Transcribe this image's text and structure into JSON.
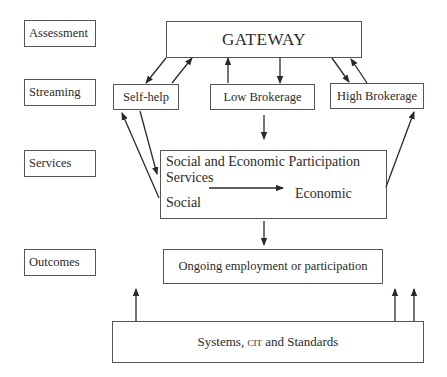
{
  "stages": [
    {
      "id": "assessment",
      "label": "Assessment"
    },
    {
      "id": "streaming",
      "label": "Streaming"
    },
    {
      "id": "services",
      "label": "Services"
    },
    {
      "id": "outcomes",
      "label": "Outcomes"
    }
  ],
  "nodes": {
    "gateway": "GATEWAY",
    "self_help": "Self-help",
    "low_brokerage": "Low Brokerage",
    "high_brokerage": "High Brokerage",
    "services": {
      "title_line1": "Social and Economic Participation",
      "title_line2": "Services",
      "social": "Social",
      "economic": "Economic"
    },
    "outcome": "Ongoing employment or participation",
    "systems": {
      "prefix": "Systems, ",
      "cit": "CIT",
      "suffix": " and Standards"
    }
  },
  "edges": [
    {
      "from": "gateway",
      "to": "self_help"
    },
    {
      "from": "self_help",
      "to": "gateway"
    },
    {
      "from": "low_brokerage",
      "to": "gateway"
    },
    {
      "from": "gateway",
      "to": "low_brokerage"
    },
    {
      "from": "gateway",
      "to": "high_brokerage"
    },
    {
      "from": "high_brokerage",
      "to": "gateway"
    },
    {
      "from": "self_help",
      "to": "services"
    },
    {
      "from": "services",
      "to": "self_help"
    },
    {
      "from": "low_brokerage",
      "to": "services"
    },
    {
      "from": "services",
      "to": "high_brokerage"
    },
    {
      "from": "social",
      "to": "economic"
    },
    {
      "from": "services",
      "to": "outcome"
    },
    {
      "from": "systems",
      "to": "outcome"
    }
  ],
  "colors": {
    "line": "#2a2a2a",
    "border": "#555555"
  }
}
